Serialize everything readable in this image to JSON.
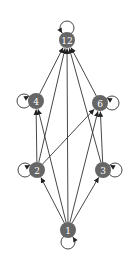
{
  "diagram": {
    "type": "directed-graph (Hasse-like divisor lattice of 12 with self-loops)",
    "nodes": [
      {
        "id": "12",
        "label": "12",
        "x": 67,
        "y": 40
      },
      {
        "id": "4",
        "label": "4",
        "x": 36,
        "y": 101
      },
      {
        "id": "6",
        "label": "6",
        "x": 100,
        "y": 103
      },
      {
        "id": "2",
        "label": "2",
        "x": 37,
        "y": 170
      },
      {
        "id": "3",
        "label": "3",
        "x": 103,
        "y": 170
      },
      {
        "id": "1",
        "label": "1",
        "x": 68,
        "y": 230
      }
    ],
    "edges": [
      {
        "from": "1",
        "to": "2"
      },
      {
        "from": "1",
        "to": "3"
      },
      {
        "from": "1",
        "to": "4"
      },
      {
        "from": "1",
        "to": "6"
      },
      {
        "from": "1",
        "to": "12"
      },
      {
        "from": "2",
        "to": "4"
      },
      {
        "from": "2",
        "to": "6"
      },
      {
        "from": "2",
        "to": "12"
      },
      {
        "from": "3",
        "to": "6"
      },
      {
        "from": "3",
        "to": "12"
      },
      {
        "from": "4",
        "to": "12"
      },
      {
        "from": "6",
        "to": "12"
      }
    ],
    "self_loops": [
      {
        "node": "12",
        "side": "top"
      },
      {
        "node": "4",
        "side": "left"
      },
      {
        "node": "6",
        "side": "right"
      },
      {
        "node": "2",
        "side": "left"
      },
      {
        "node": "3",
        "side": "right"
      },
      {
        "node": "1",
        "side": "bottom"
      }
    ],
    "colors": {
      "node_fill": "#666666",
      "label": "#ffffff",
      "edge": "#333333"
    }
  }
}
